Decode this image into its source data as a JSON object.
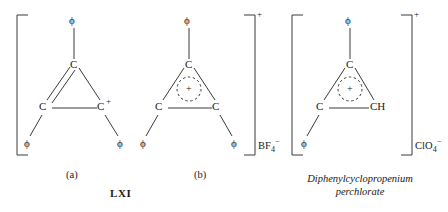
{
  "figure": {
    "name": "LXI",
    "background_color": "#ffffff",
    "ink_color": "#1a1a1a"
  },
  "structures": [
    {
      "id": "a",
      "label": "(a)",
      "bracket": {
        "left": true,
        "right": false,
        "charge": ""
      },
      "counterion": "",
      "ring_center_symbol": "",
      "atoms": {
        "apex": "C",
        "bottom_left": "C",
        "bottom_right": "C",
        "bottom_right_charge": "+"
      },
      "substituents": {
        "apex": "ϕ",
        "bottom_left": "ϕ",
        "bottom_right": "ϕ"
      },
      "bonds": "apex-to-bottom-left double bond, others single"
    },
    {
      "id": "b",
      "label": "(b)",
      "bracket": {
        "left": false,
        "right": true,
        "charge": "+"
      },
      "counterion": {
        "formula": "BF",
        "subscript": "4",
        "superscript": "−"
      },
      "ring_center_symbol": "+",
      "atoms": {
        "apex": "C",
        "bottom_left": "C",
        "bottom_right": "C",
        "bottom_right_charge": ""
      },
      "substituents": {
        "apex": "ϕ",
        "bottom_left": "ϕ",
        "bottom_right": "ϕ"
      },
      "bonds": "delocalized, dashed circle with plus"
    },
    {
      "id": "c",
      "label": "",
      "bracket": {
        "left": true,
        "right": true,
        "charge": "+"
      },
      "counterion": {
        "formula": "ClO",
        "subscript": "4",
        "superscript": "−"
      },
      "ring_center_symbol": "+",
      "atoms": {
        "apex": "C",
        "bottom_left": "C",
        "bottom_right": "CH",
        "bottom_right_charge": ""
      },
      "substituents": {
        "apex": "ϕ",
        "bottom_left": "ϕ",
        "bottom_right": ""
      },
      "bonds": "delocalized, dashed circle with plus"
    }
  ],
  "captions": {
    "compound_line1": "Diphenylcyclopropenium",
    "compound_line2": "perchlorate"
  }
}
